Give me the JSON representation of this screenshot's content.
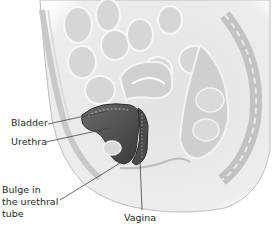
{
  "figure": {
    "labels": [
      {
        "id": "bladder",
        "text": "Bladder"
      },
      {
        "id": "urethra",
        "text": "Urethra"
      },
      {
        "id": "bulge",
        "lines": [
          "Bulge in",
          "the urethral",
          "tube"
        ]
      },
      {
        "id": "vagina",
        "text": "Vagina"
      }
    ]
  },
  "colors": {
    "background": "#ffffff",
    "tissue_light": "#e4e4e4",
    "tissue_mid": "#c4c4c4",
    "tissue_dark": "#5a5a5a",
    "leader_line": "#444444"
  }
}
